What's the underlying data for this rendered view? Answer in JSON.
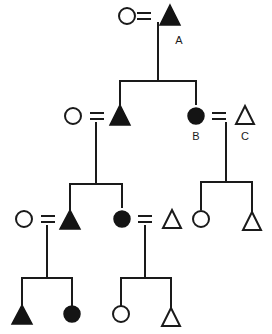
{
  "diagram": {
    "type": "pedigree",
    "width": 272,
    "height": 334,
    "background_color": "#ffffff",
    "line_color": "#1a1a1a",
    "filled_symbol_color": "#141414",
    "open_symbol_color": "#ffffff",
    "symbol_legend": {
      "circle": "female",
      "triangle": "male",
      "open": "unaffected",
      "filled": "affected",
      "equals": "mating-line"
    }
  },
  "labels": {
    "a": "A",
    "b": "B",
    "c": "C"
  },
  "generations": [
    {
      "name": "generation-1",
      "individuals": [
        {
          "id": "I-1",
          "shape": "circle",
          "fill": "open",
          "label": ""
        },
        {
          "id": "I-2",
          "shape": "triangle",
          "fill": "filled",
          "label": "A"
        }
      ]
    },
    {
      "name": "generation-2",
      "individuals": [
        {
          "id": "II-1",
          "shape": "circle",
          "fill": "open",
          "label": ""
        },
        {
          "id": "II-2",
          "shape": "triangle",
          "fill": "filled",
          "label": ""
        },
        {
          "id": "II-3",
          "shape": "circle",
          "fill": "filled",
          "label": "B"
        },
        {
          "id": "II-4",
          "shape": "triangle",
          "fill": "open",
          "label": "C"
        }
      ]
    },
    {
      "name": "generation-3",
      "individuals": [
        {
          "id": "III-1",
          "shape": "circle",
          "fill": "open",
          "label": ""
        },
        {
          "id": "III-2",
          "shape": "triangle",
          "fill": "filled",
          "label": ""
        },
        {
          "id": "III-3",
          "shape": "circle",
          "fill": "filled",
          "label": ""
        },
        {
          "id": "III-4",
          "shape": "triangle",
          "fill": "open",
          "label": ""
        },
        {
          "id": "III-5",
          "shape": "circle",
          "fill": "open",
          "label": ""
        },
        {
          "id": "III-6",
          "shape": "triangle",
          "fill": "open",
          "label": ""
        }
      ]
    },
    {
      "name": "generation-4",
      "individuals": [
        {
          "id": "IV-1",
          "shape": "triangle",
          "fill": "filled",
          "label": ""
        },
        {
          "id": "IV-2",
          "shape": "circle",
          "fill": "filled",
          "label": ""
        },
        {
          "id": "IV-3",
          "shape": "circle",
          "fill": "open",
          "label": ""
        },
        {
          "id": "IV-4",
          "shape": "triangle",
          "fill": "open",
          "label": ""
        }
      ]
    }
  ]
}
